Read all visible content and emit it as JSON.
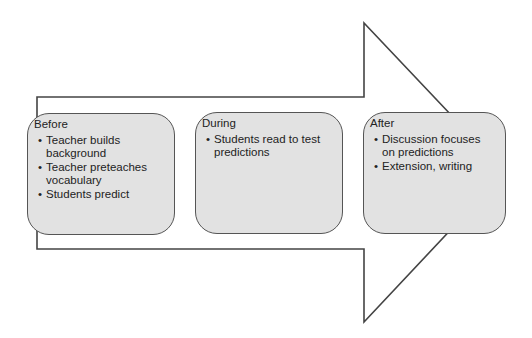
{
  "diagram": {
    "type": "process-arrow",
    "colors": {
      "box_fill": "#e2e2e2",
      "stroke": "#555555",
      "background": "#ffffff"
    },
    "stages": [
      {
        "title": "Before",
        "items": [
          "Teacher builds background",
          "Teacher preteaches vocabulary",
          "Students predict"
        ]
      },
      {
        "title": "During",
        "items": [
          "Students read to test predictions"
        ]
      },
      {
        "title": "After",
        "items": [
          "Discussion focuses on predictions",
          "Extension, writing"
        ]
      }
    ]
  }
}
